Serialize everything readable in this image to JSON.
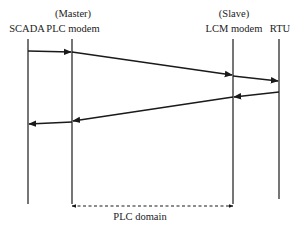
{
  "diagram": {
    "type": "sequence",
    "colors": {
      "line": "#1a1a1a",
      "text": "#222222",
      "background": "#ffffff"
    },
    "lanes": [
      {
        "id": "scada",
        "role": "",
        "label": "SCADA",
        "x": 28
      },
      {
        "id": "plc",
        "role": "(Master)",
        "label": "PLC modem",
        "x": 72
      },
      {
        "id": "lcm",
        "role": "(Slave)",
        "label": "LCM modem",
        "x": 233
      },
      {
        "id": "rtu",
        "role": "",
        "label": "RTU",
        "x": 279
      }
    ],
    "messages": [
      {
        "from": "scada",
        "to": "plc",
        "y1": 51,
        "y2": 52
      },
      {
        "from": "plc",
        "to": "lcm",
        "y1": 52,
        "y2": 75
      },
      {
        "from": "lcm",
        "to": "rtu",
        "y1": 76,
        "y2": 81
      },
      {
        "from": "rtu",
        "to": "lcm",
        "y1": 92,
        "y2": 97
      },
      {
        "from": "lcm",
        "to": "plc",
        "y1": 97,
        "y2": 121
      },
      {
        "from": "plc",
        "to": "scada",
        "y1": 122,
        "y2": 124
      }
    ],
    "domain_span": {
      "label": "PLC domain",
      "from": "plc",
      "to": "lcm",
      "style": "dashed-double-arrow"
    }
  }
}
